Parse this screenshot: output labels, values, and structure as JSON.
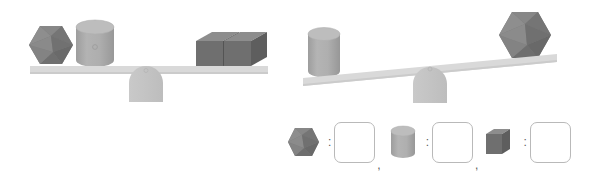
{
  "figure": {
    "type": "balance-scale-puzzle",
    "background_color": "#ffffff",
    "palette": {
      "beam": "#d9d9d9",
      "beam_shadow": "#c9c9c9",
      "fulcrum": "#c6c6c6",
      "fulcrum_shade": "#bcbcbc",
      "icosahedron_light": "#8a8a8a",
      "icosahedron_mid": "#777777",
      "icosahedron_dark": "#656565",
      "cylinder_body": "#ababab",
      "cylinder_top": "#bdbdbd",
      "cylinder_shade": "#9b9b9b",
      "cube_front": "#6f6f6f",
      "cube_top": "#8c8c8c",
      "cube_side": "#5e5e5e",
      "box_border": "#b9b9b9",
      "text": "#5c5c5c"
    }
  },
  "scales": [
    {
      "id": "scale-left",
      "name": "balanced-scale",
      "state": "balanced",
      "tilt_degrees": 0,
      "left_pan": {
        "objects": [
          {
            "shape": "icosahedron",
            "count": 1
          },
          {
            "shape": "cylinder",
            "count": 1
          }
        ]
      },
      "right_pan": {
        "objects": [
          {
            "shape": "cube",
            "count": 2
          }
        ]
      }
    },
    {
      "id": "scale-right",
      "name": "tilted-scale",
      "state": "left-side-down",
      "tilt_degrees": -9,
      "left_pan": {
        "objects": [
          {
            "shape": "cylinder",
            "count": 1
          }
        ]
      },
      "right_pan": {
        "objects": [
          {
            "shape": "icosahedron",
            "count": 1
          }
        ]
      }
    }
  ],
  "answer_row": {
    "separator_colon": ":",
    "separator_comma": ",",
    "pairs": [
      {
        "shape": "icosahedron",
        "shape_label": "icosahedron",
        "value": ""
      },
      {
        "shape": "cylinder",
        "shape_label": "cylinder",
        "value": ""
      },
      {
        "shape": "cube",
        "shape_label": "cube",
        "value": ""
      }
    ]
  }
}
